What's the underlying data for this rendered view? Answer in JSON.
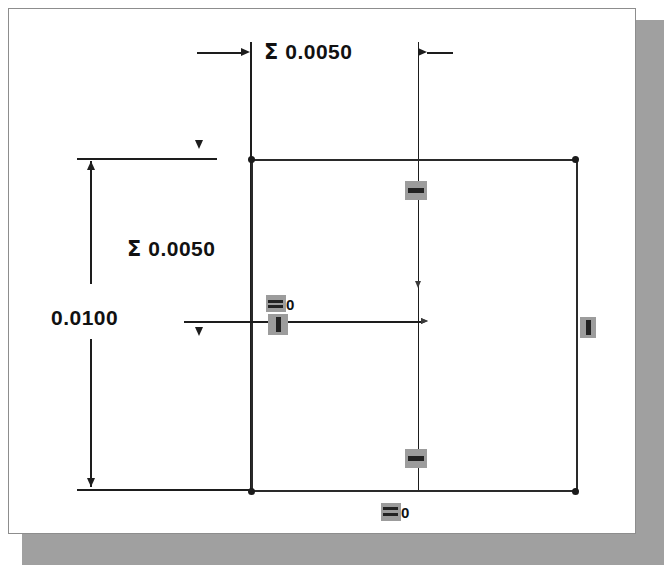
{
  "canvas": {
    "width": 664,
    "height": 569,
    "background": "#ffffff",
    "paper_color": "#ffffff",
    "paper_border": "#8d8d8d",
    "shadow_color": "#a0a0a0",
    "line_color": "#1d1d1d",
    "geometry_color": "#2a2a2a",
    "handle_color": "#9c9c9c"
  },
  "drawing": {
    "type": "cad-sketch-dimension-view",
    "sketch_shape": "rectangle",
    "dimensions": [
      {
        "id": "top-chain",
        "label": "Σ 0.0050",
        "symbol": "Σ",
        "value": "0.0050",
        "orientation": "horizontal",
        "placement": "top"
      },
      {
        "id": "left-chain",
        "label": "Σ 0.0050",
        "symbol": "Σ",
        "value": "0.0050",
        "orientation": "vertical",
        "placement": "left-upper"
      },
      {
        "id": "left-overall",
        "label": "0.0100",
        "symbol": "",
        "value": "0.0100",
        "orientation": "vertical",
        "placement": "left-outer"
      }
    ],
    "handles": [
      {
        "id": "handle-top-inner",
        "glyph": "bar-horizontal",
        "label": ""
      },
      {
        "id": "handle-mid-left",
        "glyph": "bar-horizontal",
        "label": "0"
      },
      {
        "id": "handle-mid-left-2",
        "glyph": "bar-vertical",
        "label": ""
      },
      {
        "id": "handle-right-edge",
        "glyph": "bar-vertical",
        "label": ""
      },
      {
        "id": "handle-bottom-in",
        "glyph": "bar-horizontal",
        "label": ""
      },
      {
        "id": "handle-bottom-out",
        "glyph": "bar-horizontal",
        "label": "0"
      }
    ]
  }
}
